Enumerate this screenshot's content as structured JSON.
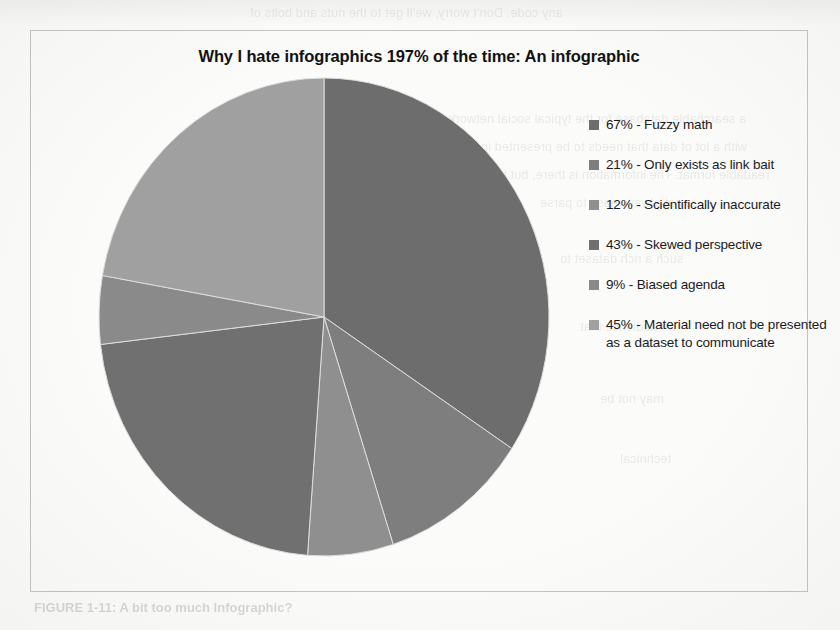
{
  "chart_data": {
    "type": "pie",
    "title": "Why I hate infographics 197% of the time: An infographic",
    "legend_position": "right",
    "grid": false,
    "categories": [
      "Fuzzy math",
      "Only exists as link bait",
      "Scientifically inaccurate",
      "Skewed perspective",
      "Biased agenda",
      "Material need not be presented as a dataset to communicate"
    ],
    "values": [
      67,
      21,
      12,
      43,
      9,
      45
    ],
    "value_unit": "%",
    "slices": [
      {
        "label": "67% - Fuzzy math",
        "value": 67,
        "color": "#6d6d6d",
        "start_angle": 0,
        "sweep_angle": 123.4
      },
      {
        "label": "21% - Only exists as link bait",
        "value": 21,
        "color": "#7e7e7e",
        "start_angle": 123.4,
        "sweep_angle": 38.7
      },
      {
        "label": "12%  - Scientifically inaccurate",
        "value": 12,
        "color": "#8f8f8f",
        "start_angle": 162.1,
        "sweep_angle": 22.1
      },
      {
        "label": "43% - Skewed perspective",
        "value": 43,
        "color": "#707070",
        "start_angle": 184.2,
        "sweep_angle": 79.2
      },
      {
        "label": "9% - Biased agenda",
        "value": 9,
        "color": "#8a8a8a",
        "start_angle": 263.4,
        "sweep_angle": 16.6
      },
      {
        "label": "45% - Material need not be presented as a dataset to communicate",
        "value": 45,
        "color": "#a0a0a0",
        "start_angle": 280.0,
        "sweep_angle": 80.0
      }
    ]
  },
  "legend": {
    "items": [
      {
        "text": "67% - Fuzzy math",
        "color": "#6d6d6d"
      },
      {
        "text": "21% - Only exists as link bait",
        "color": "#7e7e7e"
      },
      {
        "text": "12%  - Scientifically inaccurate",
        "color": "#8f8f8f"
      },
      {
        "text": "43% - Skewed perspective",
        "color": "#707070"
      },
      {
        "text": "9% - Biased agenda",
        "color": "#8a8a8a"
      },
      {
        "text": "45% - Material need not be presented as a dataset to communicate",
        "color": "#a0a0a0"
      }
    ]
  },
  "page": {
    "caption_faint": "FIGURE 1-11: A bit too much Infographic?"
  },
  "bleed_text": {
    "lines": [
      "any code. Don't worry, we'll get to the nuts and bolts of",
      "a searchable database for the typical social network user",
      "with a lot of data that needs to be presented in a",
      "readable format. The information is there, but it",
      "is not always easy to parse",
      "such a rich dataset to",
      "an audience that",
      "may not be",
      "technical"
    ]
  }
}
